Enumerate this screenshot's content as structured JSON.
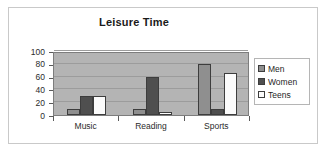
{
  "frame": {
    "border_color": "#c9c9c9"
  },
  "chart_data": {
    "type": "bar",
    "title": "Leisure Time",
    "xlabel": "",
    "ylabel": "",
    "categories": [
      "Music",
      "Reading",
      "Sports"
    ],
    "series": [
      {
        "name": "Men",
        "values": [
          10,
          10,
          80
        ],
        "color": "#8f8f8f"
      },
      {
        "name": "Women",
        "values": [
          30,
          60,
          10
        ],
        "color": "#4f4f4f"
      },
      {
        "name": "Teens",
        "values": [
          30,
          5,
          65
        ],
        "color": "#fbfbfb"
      }
    ],
    "ylim": [
      0,
      100
    ],
    "yticks": [
      0,
      20,
      40,
      60,
      80,
      100
    ],
    "ytick_labels": [
      "0",
      "20",
      "40",
      "60",
      "80",
      "100"
    ],
    "grid": true,
    "grid_axis": "y",
    "legend_position": "right",
    "plot_background": "#b4b4b4"
  }
}
